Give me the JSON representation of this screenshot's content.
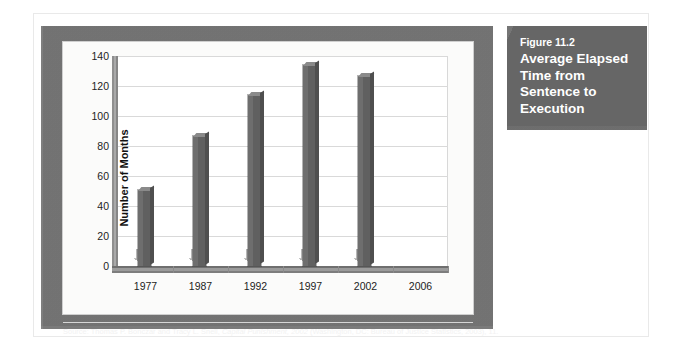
{
  "figure": {
    "number_label": "Figure 11.2",
    "title": "Average Elapsed Time from Sentence to Execution"
  },
  "source": {
    "prefix": "Source: Thomas P. Bonczar and Tracy L. Snell, ",
    "italic": "Capital Punishment, 2002",
    "suffix": " (Washington, DC: Bureau of Justice Statistics, 2003), 11.",
    "full": "Source: Thomas P. Bonczar and Tracy L. Snell, Capital Punishment, 2002 (Washington, DC: Bureau of Justice Statistics, 2003), 11."
  },
  "colors": {
    "panel_gray": "#7b7b7b",
    "title_block_gray": "#6f6f6f",
    "bar_front": "#606060",
    "bar_left_face": "#6e6e6e",
    "bar_top": "#8a8a8a",
    "plot_background": "#ffffff",
    "gridline": "#d9d9d9",
    "text": "#1d1d1d",
    "title_text": "#ffffff"
  },
  "chart_data": {
    "type": "bar",
    "title": "Average Elapsed Time from Sentence to Execution",
    "subtitle": "Figure 11.2",
    "xlabel": "",
    "ylabel": "Number of Months",
    "categories": [
      "1977",
      "1987",
      "1992",
      "1997",
      "2002",
      "2006"
    ],
    "values": [
      51,
      87,
      114,
      134,
      127,
      null
    ],
    "ylim": [
      0,
      140
    ],
    "yticks": [
      0,
      20,
      40,
      60,
      80,
      100,
      120,
      140
    ],
    "ytick_labels": [
      "0",
      "20",
      "40",
      "60",
      "80",
      "100",
      "120",
      "140"
    ],
    "grid": true,
    "grid_axis": "y",
    "legend": false,
    "series": [
      {
        "name": "Average elapsed time (months)",
        "values": [
          51,
          87,
          114,
          134,
          127,
          null
        ]
      }
    ]
  }
}
